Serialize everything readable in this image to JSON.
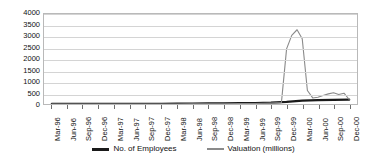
{
  "chart_data": {
    "type": "line",
    "title": "",
    "xlabel": "",
    "ylabel": "",
    "ylim": [
      0,
      4000
    ],
    "y_ticks": [
      "0",
      "500",
      "1000",
      "1500",
      "2000",
      "2500",
      "3000",
      "3500",
      "4000"
    ],
    "grid": true,
    "legend_position": "bottom",
    "categories": [
      "Mar-96",
      "Jun-96",
      "Sep-96",
      "Dec-96",
      "Mar-97",
      "Jun-97",
      "Sep-97",
      "Dec-97",
      "Mar-98",
      "Jun-98",
      "Sep-98",
      "Dec-98",
      "Mar-99",
      "Jun-99",
      "Sep-99",
      "Dec-99",
      "Mar-00",
      "Jun-00",
      "Sep-00",
      "Dec-00"
    ],
    "x_tick_labels": [
      "Mar-96",
      "Jun-96",
      "Sep-96",
      "Dec-96",
      "Mar-97",
      "Jun-97",
      "Sep-97",
      "Dec-97",
      "Mar-98",
      "Jun-98",
      "Sep-98",
      "Dec-98",
      "Mar-99",
      "Jun-99",
      "Sep-99",
      "Dec-99",
      "Mar-00",
      "Jun-00",
      "Sep-00",
      "Dec-00"
    ],
    "series": [
      {
        "name": "No. of Employees",
        "color": "#1a1a1a",
        "width": 2.2,
        "values": [
          2,
          3,
          4,
          5,
          6,
          8,
          10,
          12,
          14,
          20,
          24,
          30,
          38,
          45,
          60,
          95,
          150,
          175,
          185,
          195
        ]
      },
      {
        "name": "Valuation (millions)",
        "color": "#8a8a8a",
        "width": 1.1,
        "values": [
          0,
          0,
          0,
          0,
          0,
          0,
          0,
          0,
          0,
          5,
          8,
          12,
          18,
          25,
          40,
          2700,
          3300,
          290,
          470,
          210
        ]
      }
    ],
    "valuation_detail": {
      "note": "Valuation spikes sharply between Dec-99 and Mar-00 then collapses",
      "x": [
        "Sep-99",
        "Nov-99",
        "Dec-99",
        "Jan-00",
        "Feb-00",
        "Mar-00",
        "Apr-00",
        "May-00",
        "Jun-00",
        "Jul-00",
        "Aug-00",
        "Sep-00",
        "Oct-00",
        "Nov-00",
        "Dec-00"
      ],
      "y": [
        40,
        60,
        2450,
        3050,
        3300,
        2900,
        600,
        270,
        300,
        380,
        450,
        500,
        420,
        480,
        200
      ],
      "peak_value": 3300,
      "peak_label": "Feb-00"
    }
  },
  "legend": {
    "items": [
      {
        "label": "No. of Employees",
        "color": "#1a1a1a",
        "style": "thick"
      },
      {
        "label": "Valuation (millions)",
        "color": "#8a8a8a",
        "style": "thin"
      }
    ]
  }
}
